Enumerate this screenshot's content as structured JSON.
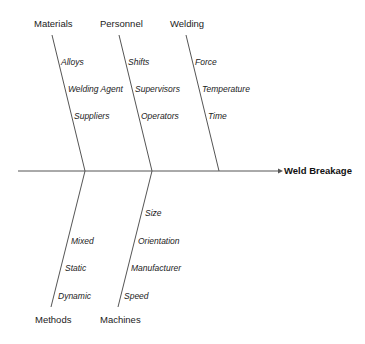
{
  "diagram": {
    "type": "fishbone",
    "effect": "Weld Breakage",
    "categories": [
      {
        "name": "Materials",
        "position": "top",
        "causes": [
          "Alloys",
          "Welding Agent",
          "Suppliers"
        ]
      },
      {
        "name": "Personnel",
        "position": "top",
        "causes": [
          "Shifts",
          "Supervisors",
          "Operators"
        ]
      },
      {
        "name": "Welding",
        "position": "top",
        "causes": [
          "Force",
          "Temperature",
          "Time"
        ]
      },
      {
        "name": "Methods",
        "position": "bottom",
        "causes": [
          "Mixed",
          "Static",
          "Dynamic"
        ]
      },
      {
        "name": "Machines",
        "position": "bottom",
        "causes": [
          "Size",
          "Orientation",
          "Manufacturer",
          "Speed"
        ]
      }
    ],
    "line_color": "#555555"
  }
}
